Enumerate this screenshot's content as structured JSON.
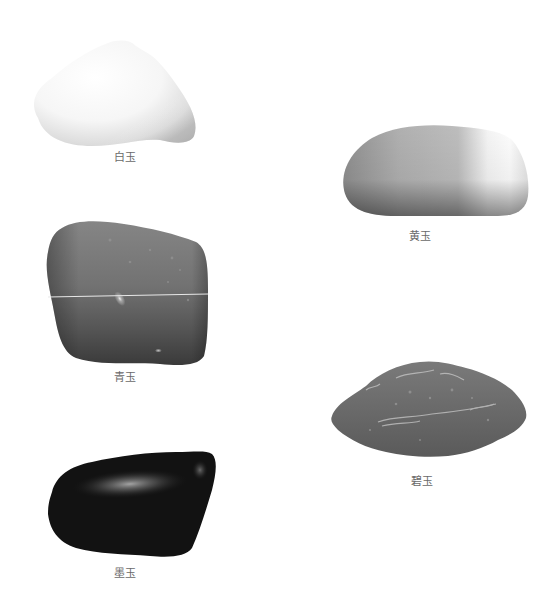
{
  "figure": {
    "specimens": [
      {
        "id": "white",
        "label": "白玉",
        "tone": "#f2f2f2"
      },
      {
        "id": "yellow",
        "label": "黄玉",
        "tone": "#b8b8b8"
      },
      {
        "id": "celadon",
        "label": "青玉",
        "tone": "#6e6e6e"
      },
      {
        "id": "green",
        "label": "碧玉",
        "tone": "#6a6a6a"
      },
      {
        "id": "black",
        "label": "墨玉",
        "tone": "#141414"
      }
    ]
  }
}
